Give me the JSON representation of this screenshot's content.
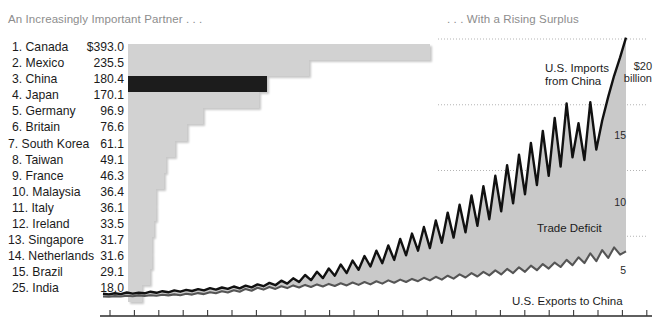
{
  "headings": {
    "left": "An Increasingly Important Partner . . .",
    "right": ". . . With a Rising Surplus"
  },
  "colors": {
    "bar": "#d2d2d2",
    "bar_highlight": "#1c1c1c",
    "area_fill": "#c9c9c9",
    "imports_line": "#111111",
    "exports_line": "#555555",
    "heading_text": "#8d8d8d",
    "body_text": "#1b1b1b"
  },
  "chart_data": [
    {
      "type": "bar",
      "title": "An Increasingly Important Partner . . .",
      "xlabel": "",
      "ylabel": "",
      "orientation": "horizontal",
      "value_unit": "billions of dollars",
      "highlight_category": "China",
      "categories": [
        "1. Canada",
        "2. Mexico",
        "3. China",
        "4. Japan",
        "5. Germany",
        "6. Britain",
        "7. South Korea",
        "8. Taiwan",
        "9. France",
        "10. Malaysia",
        "11. Italy",
        "12. Ireland",
        "13. Singapore",
        "14. Netherlands",
        "15. Brazil",
        "25. India"
      ],
      "value_labels": [
        "$393.0",
        "235.5",
        "180.4",
        "170.1",
        "96.9",
        "76.6",
        "61.1",
        "49.1",
        "46.3",
        "36.4",
        "36.1",
        "33.5",
        "31.7",
        "31.6",
        "29.1",
        "18.0"
      ],
      "values": [
        393.0,
        235.5,
        180.4,
        170.1,
        96.9,
        76.6,
        61.1,
        49.1,
        46.3,
        36.4,
        36.1,
        33.5,
        31.7,
        31.6,
        29.1,
        18.0
      ],
      "xlim": [
        0,
        393.0
      ],
      "grid": false
    },
    {
      "type": "area",
      "title": ". . . With a Rising Surplus",
      "xlabel": "",
      "ylabel": "$ billion",
      "ylim": [
        0,
        20
      ],
      "yticks": [
        5,
        10,
        15,
        20
      ],
      "ytick_labels": [
        "5",
        "10",
        "15",
        "$20"
      ],
      "yaxis_unit_label": "billion",
      "grid": true,
      "grid_style": "dotted-horizontal",
      "legend_position": "inline-annotations",
      "annotations": [
        "U.S. Imports from China",
        "Trade Deficit",
        "U.S. Exports to China"
      ],
      "series": [
        {
          "name": "U.S. Imports from China",
          "values": [
            0.62,
            0.58,
            0.66,
            0.6,
            0.72,
            0.64,
            0.7,
            0.66,
            0.78,
            0.7,
            0.82,
            0.74,
            0.88,
            0.78,
            0.92,
            0.84,
            0.98,
            0.88,
            1.05,
            0.94,
            1.1,
            1.0,
            1.18,
            1.04,
            1.25,
            1.12,
            1.34,
            1.2,
            1.45,
            1.28,
            1.62,
            1.4,
            1.8,
            1.52,
            2.05,
            1.66,
            2.3,
            1.82,
            2.55,
            2.0,
            2.85,
            2.2,
            3.15,
            2.45,
            3.5,
            2.7,
            3.9,
            2.95,
            4.3,
            3.2,
            4.8,
            3.55,
            5.2,
            3.9,
            5.7,
            4.1,
            6.2,
            4.5,
            6.8,
            4.9,
            7.4,
            5.3,
            8.1,
            5.8,
            8.8,
            6.3,
            9.6,
            6.9,
            10.4,
            7.5,
            11.2,
            8.2,
            12.1,
            8.9,
            13.0,
            9.6,
            14.0,
            10.3,
            15.1,
            11.0,
            13.6,
            10.8,
            15.2,
            11.6,
            13.8,
            15.6,
            17.2,
            18.6,
            20.1
          ]
        },
        {
          "name": "U.S. Exports to China",
          "values": [
            0.42,
            0.4,
            0.45,
            0.42,
            0.48,
            0.44,
            0.5,
            0.46,
            0.52,
            0.48,
            0.55,
            0.5,
            0.58,
            0.52,
            0.62,
            0.56,
            0.68,
            0.6,
            0.74,
            0.66,
            0.82,
            0.72,
            0.9,
            0.78,
            1.0,
            0.86,
            1.08,
            0.94,
            1.14,
            1.0,
            1.2,
            1.06,
            1.26,
            1.1,
            1.3,
            1.14,
            1.34,
            1.18,
            1.38,
            1.22,
            1.42,
            1.26,
            1.48,
            1.3,
            1.52,
            1.34,
            1.58,
            1.4,
            1.64,
            1.46,
            1.7,
            1.52,
            1.76,
            1.58,
            1.84,
            1.64,
            1.92,
            1.7,
            2.0,
            1.78,
            2.1,
            1.86,
            2.2,
            1.94,
            2.3,
            2.02,
            2.4,
            2.1,
            2.52,
            2.2,
            2.64,
            2.3,
            2.76,
            2.42,
            2.88,
            2.54,
            3.0,
            2.66,
            3.2,
            2.8,
            3.4,
            2.96,
            3.7,
            3.1,
            3.95,
            3.35,
            4.15,
            3.6,
            3.85
          ]
        }
      ]
    }
  ]
}
